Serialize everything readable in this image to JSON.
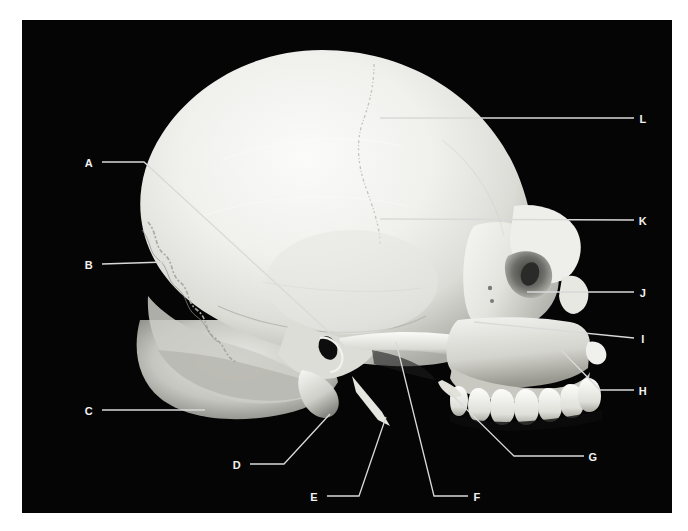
{
  "figure": {
    "background_color": "#050505",
    "frame_color": "#ffffff",
    "label_color": "#f2f2f2",
    "leader_color": "#d9d9d9",
    "bone_light": "#f4f4f2",
    "bone_mid": "#d8d8d4",
    "bone_shadow": "#9a9a96",
    "bone_dark": "#5a5a58",
    "photo": {
      "left": 22,
      "top": 20,
      "width": 650,
      "height": 493
    }
  },
  "labels": [
    {
      "id": "A",
      "text": "A",
      "x": 60,
      "y": 138,
      "leader": "M 80 142 L 122 142 L 322 326"
    },
    {
      "id": "B",
      "text": "B",
      "x": 60,
      "y": 240,
      "leader": "M 80 244 L 143 242"
    },
    {
      "id": "C",
      "text": "C",
      "x": 60,
      "y": 386,
      "leader": "M 80 390 L 183 390"
    },
    {
      "id": "D",
      "text": "D",
      "x": 208,
      "y": 440,
      "leader": "M 228 444 L 262 444 L 308 394"
    },
    {
      "id": "E",
      "text": "E",
      "x": 285,
      "y": 472,
      "leader": "M 305 476 L 337 476 L 364 397"
    },
    {
      "id": "F",
      "text": "F",
      "x": 448,
      "y": 472,
      "leader": "M 446 476 L 412 476 L 374 322"
    },
    {
      "id": "G",
      "text": "G",
      "x": 564,
      "y": 432,
      "leader": "M 562 436 L 492 436 L 427 372"
    },
    {
      "id": "H",
      "text": "H",
      "x": 614,
      "y": 366,
      "leader": "M 612 370 L 578 370 L 540 331"
    },
    {
      "id": "I",
      "text": "I",
      "x": 614,
      "y": 314,
      "leader": "M 612 318 L 452 302"
    },
    {
      "id": "J",
      "text": "J",
      "x": 614,
      "y": 268,
      "leader": "M 612 272 L 505 272"
    },
    {
      "id": "K",
      "text": "K",
      "x": 614,
      "y": 196,
      "leader": "M 612 200 L 358 199"
    },
    {
      "id": "L",
      "text": "L",
      "x": 614,
      "y": 94,
      "leader": "M 612 98 L 358 98"
    }
  ]
}
